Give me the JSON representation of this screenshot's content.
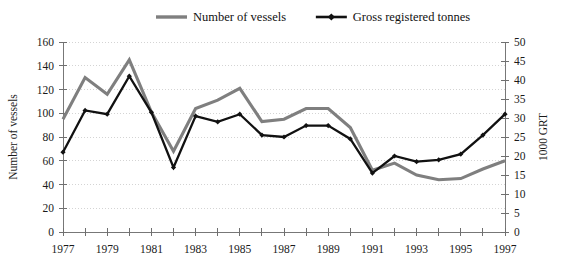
{
  "chart_data": {
    "type": "line",
    "title": "",
    "xlabel": "",
    "x": [
      1977,
      1978,
      1979,
      1980,
      1981,
      1982,
      1983,
      1984,
      1985,
      1986,
      1987,
      1988,
      1989,
      1990,
      1991,
      1992,
      1993,
      1994,
      1995,
      1996,
      1997
    ],
    "x_tick_labels": [
      "1977",
      "1979",
      "1981",
      "1983",
      "1985",
      "1987",
      "1989",
      "1991",
      "1993",
      "1995",
      "1997"
    ],
    "x_tick_values": [
      1977,
      1979,
      1981,
      1983,
      1985,
      1987,
      1989,
      1991,
      1993,
      1995,
      1997
    ],
    "xlim": [
      1977,
      1997
    ],
    "grid": true,
    "legend_position": "top-center",
    "axes": {
      "left": {
        "label": "Number of vessels",
        "ticks": [
          0,
          20,
          40,
          60,
          80,
          100,
          120,
          140,
          160
        ],
        "tick_labels": [
          "0",
          "20",
          "40",
          "60",
          "80",
          "100",
          "120",
          "140",
          "160"
        ],
        "limits": [
          0,
          160
        ]
      },
      "right": {
        "label": "1000 GRT",
        "ticks": [
          0,
          5,
          10,
          15,
          20,
          25,
          30,
          35,
          40,
          45,
          50
        ],
        "tick_labels": [
          "0",
          "5",
          "10",
          "15",
          "20",
          "25",
          "30",
          "35",
          "40",
          "45",
          "50"
        ],
        "limits": [
          0,
          50
        ]
      }
    },
    "series": [
      {
        "name": "Number of vessels",
        "axis": "left",
        "color": "#7f7f7f",
        "line_width": 3.1,
        "markers": false,
        "values": [
          95,
          130,
          116,
          145,
          101,
          68,
          104,
          111,
          121,
          93,
          95,
          104,
          104,
          88,
          52,
          58,
          48,
          44,
          45,
          53,
          60
        ]
      },
      {
        "name": "Gross registered tonnes",
        "axis": "right",
        "color": "#111111",
        "line_width": 2.3,
        "markers": true,
        "values": [
          21,
          32,
          31,
          41,
          31.5,
          17,
          30.5,
          29,
          31,
          25.5,
          25,
          28,
          28,
          24.5,
          15.5,
          20,
          18.5,
          19,
          20.5,
          25.5,
          31
        ]
      }
    ]
  },
  "legend": {
    "items": [
      {
        "label": "Number of vessels",
        "color": "#7f7f7f",
        "marker": false
      },
      {
        "label": "Gross registered tonnes",
        "color": "#111111",
        "marker": true
      }
    ]
  }
}
